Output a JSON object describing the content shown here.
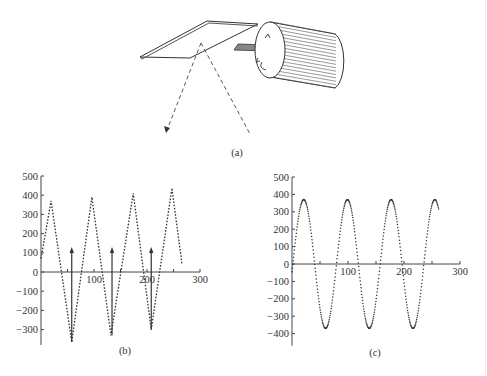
{
  "figure": {
    "panels": [
      {
        "id": "a",
        "caption": "(a)",
        "description": "Rotating cylinder with shaft driving a tilted mirror; dashed lines show incident and reflected beams, curved arrows indicate rotation"
      },
      {
        "id": "b",
        "caption": "(b)"
      },
      {
        "id": "c",
        "caption": "(c)"
      }
    ]
  },
  "chart_data": [
    {
      "panel": "b",
      "type": "line",
      "style": "dotted",
      "title": "",
      "xlabel": "",
      "ylabel": "",
      "xlim": [
        0,
        300
      ],
      "ylim": [
        -380,
        500
      ],
      "xticks": [
        100,
        200,
        300
      ],
      "yticks": [
        -300,
        -200,
        -100,
        0,
        100,
        200,
        300,
        400,
        500
      ],
      "xtick_labels": [
        "100",
        "200",
        "300"
      ],
      "ytick_labels": [
        "−300",
        "−200",
        "−100",
        "0",
        "100",
        "200",
        "300",
        "400",
        "500"
      ],
      "grid": false,
      "series": [
        {
          "name": "triangle wave",
          "x": [
            0,
            19,
            58,
            96,
            132,
            174,
            208,
            247,
            266
          ],
          "y": [
            70,
            370,
            -365,
            390,
            -330,
            410,
            -300,
            437,
            42
          ]
        }
      ],
      "annotations": [
        {
          "type": "arrow",
          "x": 58,
          "y_from": -365,
          "y_to": 125
        },
        {
          "type": "arrow",
          "x": 134,
          "y_from": -330,
          "y_to": 125
        },
        {
          "type": "arrow",
          "x": 208,
          "y_from": -300,
          "y_to": 125
        }
      ]
    },
    {
      "panel": "c",
      "type": "line",
      "style": "dotted",
      "title": "",
      "xlabel": "",
      "ylabel": "",
      "xlim": [
        0,
        300
      ],
      "ylim": [
        -470,
        500
      ],
      "xticks": [
        100,
        200,
        300
      ],
      "yticks": [
        -400,
        -300,
        -200,
        -100,
        0,
        100,
        200,
        300,
        400,
        500
      ],
      "xtick_labels": [
        "100",
        "200",
        "300"
      ],
      "ytick_labels": [
        "−400",
        "−300",
        "−200",
        "−100",
        "0",
        "100",
        "200",
        "300",
        "400",
        "500"
      ],
      "grid": false,
      "series": [
        {
          "name": "sine wave",
          "amplitude": 370,
          "period": 78,
          "phase_peak_x": 21,
          "x_range": [
            0,
            262
          ],
          "x": [
            0,
            21,
            40,
            60,
            79,
            99,
            118,
            138,
            157,
            177,
            196,
            216,
            235,
            255,
            262
          ],
          "y": [
            0,
            370,
            0,
            -370,
            0,
            370,
            0,
            -370,
            0,
            370,
            0,
            -370,
            0,
            370,
            300
          ]
        }
      ]
    }
  ]
}
